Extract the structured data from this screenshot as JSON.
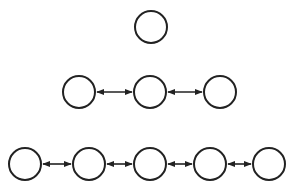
{
  "diagram": {
    "title": "",
    "stroke_color": "#222222",
    "background": "#ffffff",
    "node_radius": 16,
    "rows": [
      {
        "name": "row-1",
        "nodes": [
          {
            "cx": 151,
            "cy": 27
          }
        ]
      },
      {
        "name": "row-2",
        "nodes": [
          {
            "cx": 79,
            "cy": 92
          },
          {
            "cx": 150,
            "cy": 92
          },
          {
            "cx": 220,
            "cy": 92
          }
        ]
      },
      {
        "name": "row-3",
        "nodes": [
          {
            "cx": 25,
            "cy": 164
          },
          {
            "cx": 89,
            "cy": 164
          },
          {
            "cx": 150,
            "cy": 164
          },
          {
            "cx": 210,
            "cy": 164
          },
          {
            "cx": 269,
            "cy": 164
          }
        ]
      }
    ],
    "edges": [
      {
        "row": 1,
        "from": 0,
        "to": 1,
        "type": "bidirectional"
      },
      {
        "row": 1,
        "from": 1,
        "to": 2,
        "type": "bidirectional"
      },
      {
        "row": 2,
        "from": 0,
        "to": 1,
        "type": "bidirectional"
      },
      {
        "row": 2,
        "from": 1,
        "to": 2,
        "type": "bidirectional"
      },
      {
        "row": 2,
        "from": 2,
        "to": 3,
        "type": "bidirectional"
      },
      {
        "row": 2,
        "from": 3,
        "to": 4,
        "type": "bidirectional"
      }
    ]
  }
}
